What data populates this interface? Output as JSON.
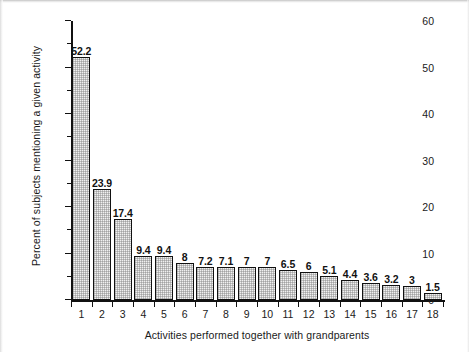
{
  "chart_data": {
    "type": "bar",
    "title": "",
    "subtitle": "",
    "xlabel": "Activities performed together with grandparents",
    "ylabel": "Percent of subjects mentioning a given activity",
    "categories": [
      "1",
      "2",
      "3",
      "4",
      "5",
      "6",
      "7",
      "8",
      "9",
      "10",
      "11",
      "12",
      "13",
      "14",
      "15",
      "16",
      "17",
      "18"
    ],
    "values": [
      52.2,
      23.9,
      17.4,
      9.4,
      9.4,
      8,
      7.2,
      7.1,
      7,
      7,
      6.5,
      6,
      5.1,
      4.4,
      3.6,
      3.2,
      3,
      1.5
    ],
    "value_labels": [
      "52.2",
      "23.9",
      "17.4",
      "9.4",
      "9.4",
      "8",
      "7.2",
      "7.1",
      "7",
      "7",
      "6.5",
      "6",
      "5.1",
      "4.4",
      "3.6",
      "3.2",
      "3",
      "1.5"
    ],
    "ylim": [
      0,
      60
    ],
    "ytick_major": [
      "0",
      "10",
      "20",
      "30",
      "40",
      "50",
      "60"
    ],
    "ytick_major_values": [
      0,
      10,
      20,
      30,
      40,
      50,
      60
    ],
    "ytick_minor_values": [
      5,
      15,
      25,
      35,
      45,
      55
    ],
    "grid": false,
    "legend": false,
    "legend_position": "none",
    "bar_fill_color": "#f0f0f0",
    "bar_edge_color": "#111111",
    "axis_color": "#111111",
    "background_color": "#ffffff",
    "data_label_style": "bold"
  }
}
